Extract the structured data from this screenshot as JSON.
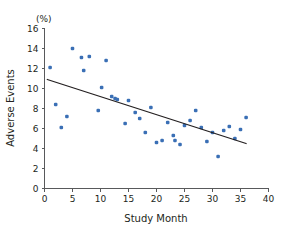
{
  "chart_data": {
    "type": "scatter",
    "title": "",
    "xlabel": "Study Month",
    "ylabel": "Adverse Events",
    "yunit": "(%)",
    "xlim": [
      0,
      40
    ],
    "ylim": [
      0,
      16
    ],
    "xticks": [
      0,
      5,
      10,
      15,
      20,
      25,
      30,
      35,
      40
    ],
    "yticks": [
      0,
      2,
      4,
      6,
      8,
      10,
      12,
      14,
      16
    ],
    "grid": false,
    "legend": null,
    "point_color": "#3a6fb5",
    "line_color": "#231f20",
    "axis_color": "#58595b",
    "series": [
      {
        "name": "Adverse Events",
        "type": "scatter",
        "points": [
          {
            "x": 1,
            "y": 12.1
          },
          {
            "x": 2,
            "y": 8.4
          },
          {
            "x": 3,
            "y": 6.1
          },
          {
            "x": 4,
            "y": 7.2
          },
          {
            "x": 5,
            "y": 14.0
          },
          {
            "x": 6.6,
            "y": 13.1
          },
          {
            "x": 7,
            "y": 11.8
          },
          {
            "x": 8,
            "y": 13.2
          },
          {
            "x": 9.6,
            "y": 7.8
          },
          {
            "x": 10.2,
            "y": 10.1
          },
          {
            "x": 11,
            "y": 12.8
          },
          {
            "x": 12,
            "y": 9.2
          },
          {
            "x": 12.6,
            "y": 9.0
          },
          {
            "x": 13,
            "y": 8.9
          },
          {
            "x": 14.4,
            "y": 6.5
          },
          {
            "x": 15,
            "y": 8.8
          },
          {
            "x": 16.2,
            "y": 7.6
          },
          {
            "x": 17,
            "y": 7.0
          },
          {
            "x": 18,
            "y": 5.6
          },
          {
            "x": 19,
            "y": 8.1
          },
          {
            "x": 20,
            "y": 4.6
          },
          {
            "x": 21,
            "y": 4.8
          },
          {
            "x": 22,
            "y": 6.6
          },
          {
            "x": 23,
            "y": 5.3
          },
          {
            "x": 23.3,
            "y": 4.8
          },
          {
            "x": 24.2,
            "y": 4.4
          },
          {
            "x": 25,
            "y": 6.3
          },
          {
            "x": 26,
            "y": 6.8
          },
          {
            "x": 27,
            "y": 7.8
          },
          {
            "x": 28,
            "y": 6.1
          },
          {
            "x": 29,
            "y": 4.7
          },
          {
            "x": 30,
            "y": 5.6
          },
          {
            "x": 31,
            "y": 3.2
          },
          {
            "x": 32,
            "y": 5.8
          },
          {
            "x": 33,
            "y": 6.2
          },
          {
            "x": 34,
            "y": 5.0
          },
          {
            "x": 35,
            "y": 5.9
          },
          {
            "x": 36,
            "y": 7.1
          }
        ]
      },
      {
        "name": "Trend line",
        "type": "line",
        "points": [
          {
            "x": 0.5,
            "y": 10.9
          },
          {
            "x": 36,
            "y": 4.5
          }
        ]
      }
    ]
  }
}
